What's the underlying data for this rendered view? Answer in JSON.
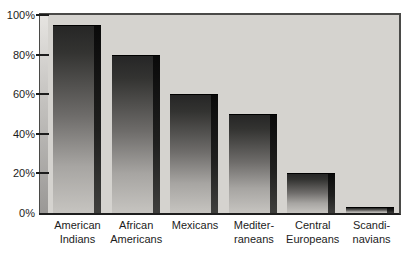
{
  "chart_data": {
    "type": "bar",
    "categories": [
      "American\nIndians",
      "African\nAmericans",
      "Mexicans",
      "Mediter-\nraneans",
      "Central\nEuropeans",
      "Scandi-\nnavians"
    ],
    "values": [
      95,
      80,
      60,
      50,
      20,
      3
    ],
    "title": "",
    "xlabel": "",
    "ylabel": "",
    "ylim": [
      0,
      100
    ],
    "yticks": [
      0,
      20,
      40,
      60,
      80,
      100
    ],
    "ytick_labels": [
      "0%",
      "20%",
      "40%",
      "60%",
      "80%",
      "100%"
    ],
    "grid": false,
    "legend": false,
    "bar_style": "3d-gradient-grayscale"
  },
  "colors": {
    "page_bg": "#ffffff",
    "plot_bg": "#d5d3cf",
    "border": "#4a4a48",
    "axis_line": "#1e1e1e",
    "tick": "#1c1c1c",
    "text": "#1c1c1c",
    "bar_gradient_top": "#262626",
    "bar_gradient_bottom": "#c6c4c0",
    "bar_edge_top": "#0a0a0a",
    "bar_edge_bottom": "#3f3f3d",
    "axis_band_top": "#e6e4e1",
    "axis_band_mid": "#c3c1be",
    "axis_band_bottom": "#9a9896"
  }
}
